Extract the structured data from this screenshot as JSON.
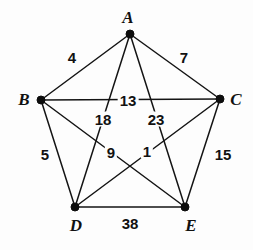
{
  "figure": {
    "type": "graph-diagram",
    "background_color": "#fdfdfd",
    "ink_color": "#141414",
    "width": 253,
    "height": 250
  },
  "vertices": [
    {
      "id": "A",
      "label": "A",
      "x": 130,
      "y": 34,
      "label_x": 128,
      "label_y": 17
    },
    {
      "id": "B",
      "label": "B",
      "x": 41,
      "y": 100,
      "label_x": 24,
      "label_y": 99
    },
    {
      "id": "C",
      "label": "C",
      "x": 220,
      "y": 99,
      "label_x": 236,
      "label_y": 99
    },
    {
      "id": "D",
      "label": "D",
      "x": 75,
      "y": 207,
      "label_x": 76,
      "label_y": 225
    },
    {
      "id": "E",
      "label": "E",
      "x": 185,
      "y": 207,
      "label_x": 191,
      "label_y": 225
    }
  ],
  "edges": [
    {
      "from": "A",
      "to": "B",
      "weight": "4",
      "label_x": 72,
      "label_y": 57,
      "masked": false
    },
    {
      "from": "A",
      "to": "C",
      "weight": "7",
      "label_x": 184,
      "label_y": 57,
      "masked": false
    },
    {
      "from": "B",
      "to": "C",
      "weight": "13",
      "label_x": 128,
      "label_y": 100,
      "masked": true
    },
    {
      "from": "A",
      "to": "D",
      "weight": "18",
      "label_x": 103,
      "label_y": 119,
      "masked": true
    },
    {
      "from": "A",
      "to": "E",
      "weight": "23",
      "label_x": 156,
      "label_y": 119,
      "masked": true
    },
    {
      "from": "B",
      "to": "D",
      "weight": "5",
      "label_x": 45,
      "label_y": 154,
      "masked": false
    },
    {
      "from": "C",
      "to": "E",
      "weight": "15",
      "label_x": 223,
      "label_y": 154,
      "masked": false
    },
    {
      "from": "B",
      "to": "E",
      "weight": "9",
      "label_x": 111,
      "label_y": 152,
      "masked": true
    },
    {
      "from": "C",
      "to": "D",
      "weight": "1",
      "label_x": 147,
      "label_y": 151,
      "masked": true
    },
    {
      "from": "D",
      "to": "E",
      "weight": "38",
      "label_x": 130,
      "label_y": 223,
      "masked": false
    }
  ],
  "chart_data": {
    "type": "graph",
    "node_count": 5,
    "edge_count": 10,
    "nodes": [
      "A",
      "B",
      "C",
      "D",
      "E"
    ],
    "edge_weights": [
      {
        "edge": "A-B",
        "weight": 4
      },
      {
        "edge": "A-C",
        "weight": 7
      },
      {
        "edge": "A-D",
        "weight": 18
      },
      {
        "edge": "A-E",
        "weight": 23
      },
      {
        "edge": "B-C",
        "weight": 13
      },
      {
        "edge": "B-D",
        "weight": 5
      },
      {
        "edge": "B-E",
        "weight": 9
      },
      {
        "edge": "C-D",
        "weight": 1
      },
      {
        "edge": "C-E",
        "weight": 15
      },
      {
        "edge": "D-E",
        "weight": 38
      }
    ],
    "weight_matrix": {
      "labels": [
        "A",
        "B",
        "C",
        "D",
        "E"
      ],
      "rows": [
        [
          0,
          4,
          7,
          18,
          23
        ],
        [
          4,
          0,
          13,
          5,
          9
        ],
        [
          7,
          13,
          0,
          1,
          15
        ],
        [
          18,
          5,
          1,
          0,
          38
        ],
        [
          23,
          9,
          15,
          38,
          0
        ]
      ]
    },
    "legend": [],
    "grid": false
  }
}
